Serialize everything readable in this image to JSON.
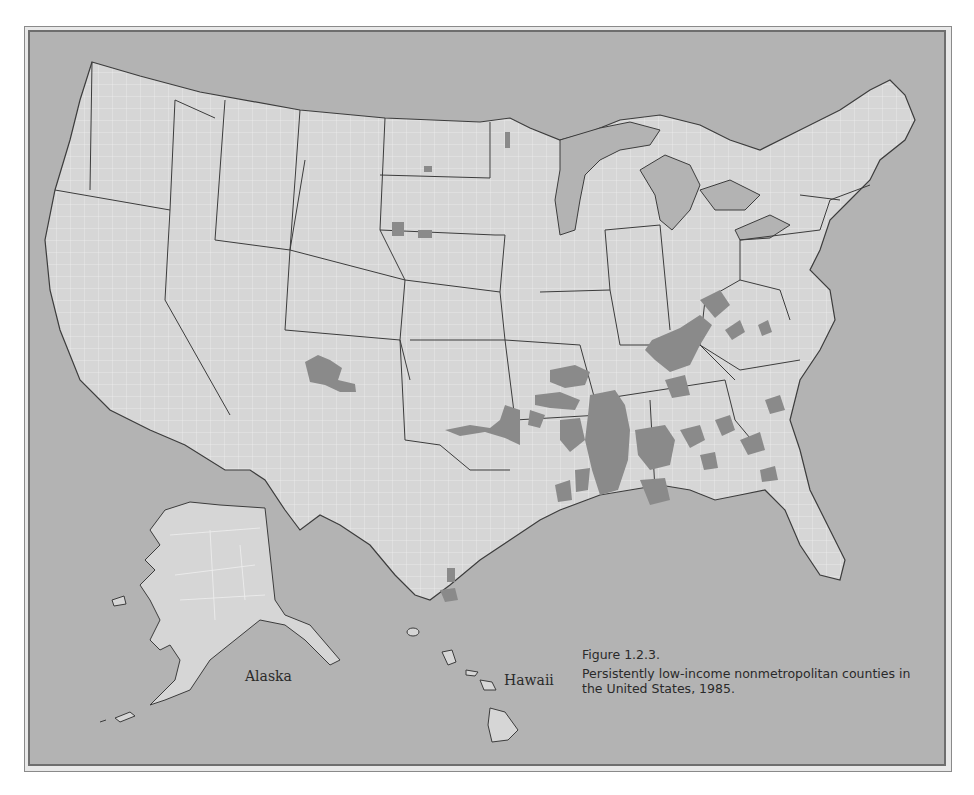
{
  "figure": {
    "number": "Figure 1.2.3.",
    "caption": "Persistently low-income nonmetropolitan counties in the United States, 1985."
  },
  "map": {
    "labels": {
      "alaska": "Alaska",
      "hawaii": "Hawaii"
    },
    "colors": {
      "background": "#b3b3b3",
      "land": "#d6d6d6",
      "highlighted_counties": "#8a8a8a",
      "state_borders": "#3c3c3c",
      "county_borders": "#f0f0f0"
    },
    "highlighted_regions": [
      "Mississippi Delta (MS, AR, LA)",
      "Appalachia (KY, WV, TN, VA)",
      "Alabama Black Belt",
      "Georgia and South Carolina",
      "Eastern Oklahoma",
      "Missouri Bootheel / Ozarks",
      "Northern New Mexico / Southern Colorado",
      "South Dakota reservations",
      "North Dakota / Minnesota",
      "South Texas"
    ]
  }
}
